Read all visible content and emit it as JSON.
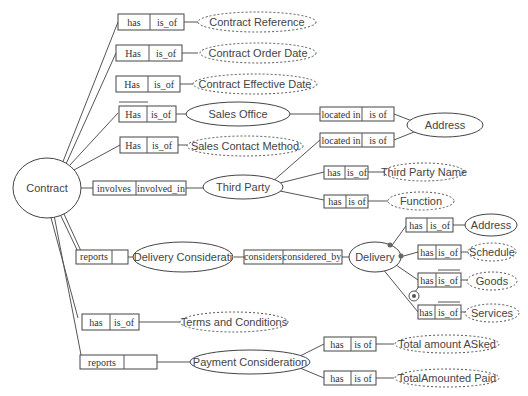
{
  "diagram": {
    "root": {
      "label": "Contract"
    },
    "relations": [
      {
        "id": "r1",
        "left": "has",
        "right": "is_of",
        "target": "Contract Reference",
        "target_style": "dashed"
      },
      {
        "id": "r2",
        "left": "Has",
        "right": "is_of",
        "target": "Contract Order Date",
        "target_style": "dashed"
      },
      {
        "id": "r3",
        "left": "Has",
        "right": "is_of",
        "target": "Contract Effective Date",
        "target_style": "dashed"
      },
      {
        "id": "r4",
        "left": "Has",
        "right": "is_of",
        "target": "Sales Office",
        "target_style": "solid"
      },
      {
        "id": "r5",
        "left": "Has",
        "right": "is_of",
        "target": "Sales Contact Method",
        "target_style": "dashed"
      },
      {
        "id": "r6",
        "left": "involves",
        "right": "involved_in",
        "target": "Third Party",
        "target_style": "solid"
      },
      {
        "id": "r7",
        "left": "reports",
        "right": "",
        "target": "Delivery Considerati",
        "target_style": "solid"
      },
      {
        "id": "r8",
        "left": "has",
        "right": "is_of",
        "target": "Terms and Conditions",
        "target_style": "dashed"
      },
      {
        "id": "r9",
        "left": "reports",
        "right": "",
        "target": "Payment Consideration",
        "target_style": "solid"
      }
    ],
    "sales_office_link": {
      "left": "located in",
      "right": "is of",
      "target": "Address"
    },
    "third_party_links": [
      {
        "left": "located in",
        "right": "is of",
        "target": "Address"
      },
      {
        "left": "has",
        "right": "is_of",
        "target": "Third Party Name"
      },
      {
        "left": "has",
        "right": "is of",
        "target": "Function"
      }
    ],
    "delivery_consideration_link": {
      "left": "considers",
      "right": "considered_by",
      "target": "Delivery"
    },
    "delivery_links": [
      {
        "left": "has",
        "right": "is_of",
        "target": "Address",
        "target_style": "solid"
      },
      {
        "left": "has",
        "right": "is_of",
        "target": "Schedule",
        "target_style": "dashed"
      },
      {
        "left": "has",
        "right": "is_of",
        "target": "Goods",
        "target_style": "dashed"
      },
      {
        "left": "has",
        "right": "is_of",
        "target": "Services",
        "target_style": "dashed"
      }
    ],
    "payment_links": [
      {
        "left": "has",
        "right": "is of",
        "target": "Total amount ASked"
      },
      {
        "left": "has",
        "right": "is of",
        "target": "TotalAmounted Paid"
      }
    ]
  }
}
